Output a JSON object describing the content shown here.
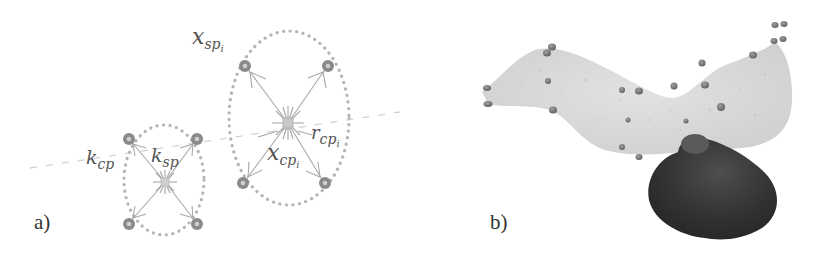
{
  "figure": {
    "panels": [
      {
        "id": "a",
        "label": "a)",
        "description": "Two clusters of sphere particles around control points, with dotted ellipses",
        "annotations": {
          "x_sp_i": {
            "base": "x",
            "sub": "sp",
            "subsub": "i"
          },
          "k_cp": {
            "base": "k",
            "sub": "cp"
          },
          "k_sp": {
            "base": "k",
            "sub": "sp"
          },
          "x_cp_i": {
            "base": "x",
            "sub": "cp",
            "subsub": "i"
          },
          "r_cp_i": {
            "base": "r",
            "sub": "cp",
            "subsub": "i"
          }
        },
        "colors": {
          "node": "#8a8a8a",
          "node_inner": "#c8c8c8",
          "ellipse_dots": "#b4b4b4",
          "spring_lines": "#a8a8a8",
          "axis_dash": "#d0d0d0",
          "text": "#555555"
        }
      },
      {
        "id": "b",
        "label": "b)",
        "description": "3D rendering of a light grey curved membrane sheet with small dark spheres, and a dark rounded object below",
        "colors": {
          "membrane": "#d6d6d6",
          "particles": "#7a7a7a",
          "dark_object": "#3a3a3a"
        }
      }
    ]
  }
}
